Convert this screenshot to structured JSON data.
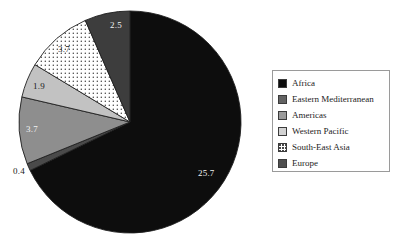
{
  "chart_data": {
    "type": "pie",
    "title": "",
    "subtitle": "",
    "xlabel": "",
    "ylabel": "",
    "legend_position": "right",
    "grid": false,
    "total": 37.9,
    "categories": [
      "Africa",
      "Eastern Mediterranean",
      "Americas",
      "Western Pacific",
      "South-East Asia",
      "Europe"
    ],
    "values": [
      25.7,
      0.4,
      3.7,
      1.9,
      3.7,
      2.5
    ],
    "slices": [
      {
        "label": "Africa",
        "value": 25.7,
        "value_text": "25.7",
        "color": "#0d0d0d",
        "pattern": "solid",
        "label_color": "#f2f2f2",
        "label_inside": true
      },
      {
        "label": "Eastern Mediterranean",
        "value": 0.4,
        "value_text": "0.4",
        "color": "#4a4a4a",
        "pattern": "solid",
        "label_color": "#1a1a1a",
        "label_inside": false
      },
      {
        "label": "Americas",
        "value": 3.7,
        "value_text": "3.7",
        "color": "#8e8e8e",
        "pattern": "solid",
        "label_color": "#f2f2f2",
        "label_inside": true
      },
      {
        "label": "Western Pacific",
        "value": 1.9,
        "value_text": "1.9",
        "color": "#c2c2c2",
        "pattern": "solid",
        "label_color": "#1a1a1a",
        "label_inside": true
      },
      {
        "label": "South-East Asia",
        "value": 3.7,
        "value_text": "3.7",
        "color": "#ffffff",
        "pattern": "dotted",
        "label_color": "#4a4a4a",
        "label_inside": true
      },
      {
        "label": "Europe",
        "value": 2.5,
        "value_text": "2.5",
        "color": "#3d3d3d",
        "pattern": "solid",
        "label_color": "#f2f2f2",
        "label_inside": true
      }
    ]
  },
  "legend": {
    "items": [
      {
        "label": "Africa",
        "color": "#0d0d0d",
        "pattern": "solid"
      },
      {
        "label": "Eastern Mediterranean",
        "color": "#636363",
        "pattern": "solid"
      },
      {
        "label": "Americas",
        "color": "#9a9a9a",
        "pattern": "solid"
      },
      {
        "label": "Western Pacific",
        "color": "#d2d2d2",
        "pattern": "solid"
      },
      {
        "label": "South-East Asia",
        "color": "#ffffff",
        "pattern": "dotted"
      },
      {
        "label": "Europe",
        "color": "#4f4f4f",
        "pattern": "solid"
      }
    ]
  },
  "labels": {
    "africa": "25.7",
    "eastern_mediterranean": "0.4",
    "americas": "3.7",
    "western_pacific": "1.9",
    "south_east_asia": "3.7",
    "europe": "2.5"
  }
}
